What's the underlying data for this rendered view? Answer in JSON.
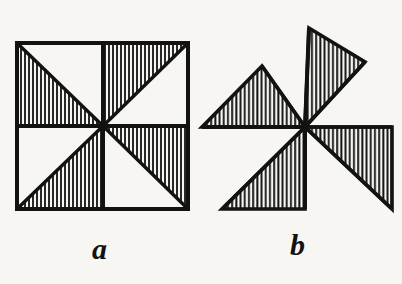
{
  "figure": {
    "kind": "line-engraving",
    "title": "",
    "background_color": "#f7f6f2",
    "ink_color": "#121212",
    "hatch_color": "#121212",
    "panels": [
      {
        "id": "a",
        "label": "a",
        "name": "pinwheel-square",
        "description": "Square divided by horizontal, vertical and two diagonal lines into eight triangles; four triangles hatched in a pinwheel arrangement.",
        "center": {
          "x": 103,
          "y": 126
        },
        "square": {
          "left": 17,
          "top": 43,
          "right": 188,
          "bottom": 209
        },
        "hatched_triangles": [
          {
            "name": "top-left-lower",
            "points": "17,43 17,126 103,126"
          },
          {
            "name": "top-right-upper",
            "points": "103,43 188,43 103,126"
          },
          {
            "name": "bottom-left-lower",
            "points": "17,209 103,209 103,126"
          },
          {
            "name": "bottom-right-upper",
            "points": "103,126 188,126 188,209"
          }
        ],
        "blank_triangles": [
          {
            "name": "top-left-upper",
            "points": "17,43 103,43 103,126"
          },
          {
            "name": "top-right-lower",
            "points": "188,43 188,126 103,126"
          },
          {
            "name": "bottom-left-upper",
            "points": "17,126 103,126 17,209"
          },
          {
            "name": "bottom-right-lower",
            "points": "103,126 103,209 188,209"
          }
        ]
      },
      {
        "id": "b",
        "label": "b",
        "name": "pinwheel-windmill",
        "description": "The four hatched triangles swung outward about the centre to form a windmill / pinwheel vane figure.",
        "center": {
          "x": 305,
          "y": 127
        },
        "hatched_triangles": [
          {
            "name": "vane-left",
            "points": "202,127 262,66 305,127"
          },
          {
            "name": "vane-top",
            "points": "305,127 309,28 365,62"
          },
          {
            "name": "vane-right",
            "points": "305,127 392,127 392,209"
          },
          {
            "name": "vane-bottom",
            "points": "305,127 305,209 222,209"
          }
        ]
      }
    ],
    "hatching": {
      "orientation": "vertical",
      "spacing_px": 4,
      "stroke_width_px": 1.6
    },
    "labels": [
      {
        "id": "label-a",
        "text": "a",
        "x": 92,
        "y": 234
      },
      {
        "id": "label-b",
        "text": "b",
        "x": 290,
        "y": 230
      }
    ]
  }
}
